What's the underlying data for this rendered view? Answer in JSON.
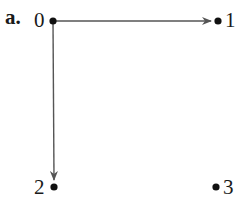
{
  "figure": {
    "panel_label": "a.",
    "nodes": [
      {
        "id": "0",
        "label": "0",
        "x": 53,
        "y": 21
      },
      {
        "id": "1",
        "label": "1",
        "x": 218,
        "y": 21
      },
      {
        "id": "2",
        "label": "2",
        "x": 54,
        "y": 187
      },
      {
        "id": "3",
        "label": "3",
        "x": 216,
        "y": 187
      }
    ],
    "edges": [
      {
        "from": "0",
        "to": "1",
        "directed": true
      },
      {
        "from": "0",
        "to": "2",
        "directed": true
      }
    ],
    "colors": {
      "edge": "#555555",
      "node": "#111111",
      "text": "#1a1a1a"
    }
  }
}
